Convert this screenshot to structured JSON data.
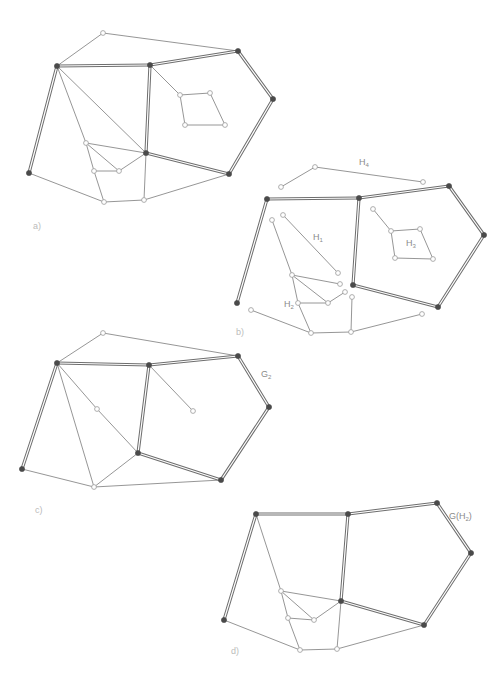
{
  "figure": {
    "panels": [
      {
        "id": "a",
        "label": "a)",
        "pos": [
          33,
          221
        ]
      },
      {
        "id": "b",
        "label": "b)",
        "pos": [
          236,
          327
        ]
      },
      {
        "id": "c",
        "label": "c)",
        "pos": [
          35,
          505
        ]
      },
      {
        "id": "d",
        "label": "d)",
        "pos": [
          231,
          646
        ]
      }
    ],
    "graph_labels": [
      {
        "id": "H4",
        "main": "H",
        "sub": "4",
        "pos": [
          359,
          157
        ]
      },
      {
        "id": "H1",
        "main": "H",
        "sub": "1",
        "pos": [
          313,
          232
        ]
      },
      {
        "id": "H3",
        "main": "H",
        "sub": "3",
        "pos": [
          406,
          238
        ]
      },
      {
        "id": "H2",
        "main": "H",
        "sub": "2",
        "pos": [
          284,
          299
        ]
      },
      {
        "id": "G2",
        "main": "G",
        "sub": "2",
        "pos": [
          261,
          369
        ]
      },
      {
        "id": "GH2",
        "main": "G(H",
        "sub": "2",
        "tail": ")",
        "pos": [
          449,
          511
        ]
      }
    ],
    "colors": {
      "edge": "#8a8a8a",
      "thick_edge": "#6e6e6e",
      "filled_node": "#4a4a4a",
      "hollow_node_stroke": "#9a9a9a"
    }
  },
  "graphs": {
    "a": {
      "nodes": {
        "t": [
          103,
          33,
          "h"
        ],
        "p1": [
          57,
          66,
          "f"
        ],
        "p2": [
          150,
          65,
          "f"
        ],
        "p3": [
          238,
          51,
          "f"
        ],
        "p4": [
          273,
          99,
          "f"
        ],
        "p5": [
          229,
          174,
          "f"
        ],
        "p6": [
          146,
          153,
          "f"
        ],
        "p7": [
          29,
          173,
          "f"
        ],
        "s1": [
          180,
          95,
          "h"
        ],
        "s2": [
          210,
          93,
          "h"
        ],
        "s3": [
          225,
          125,
          "h"
        ],
        "s4": [
          185,
          125,
          "h"
        ],
        "A": [
          86,
          143,
          "h"
        ],
        "B": [
          119,
          171,
          "h"
        ],
        "C": [
          94,
          171,
          "h"
        ],
        "D": [
          104,
          202,
          "h"
        ],
        "E": [
          144,
          200,
          "h"
        ]
      },
      "thick": [
        [
          "p1",
          "p2"
        ],
        [
          "p2",
          "p3"
        ],
        [
          "p3",
          "p4"
        ],
        [
          "p4",
          "p5"
        ],
        [
          "p5",
          "p6"
        ],
        [
          "p6",
          "p2"
        ],
        [
          "p1",
          "p7"
        ]
      ],
      "thin": [
        [
          "p1",
          "t"
        ],
        [
          "t",
          "p3"
        ],
        [
          "p1",
          "p6"
        ],
        [
          "p1",
          "A"
        ],
        [
          "A",
          "C"
        ],
        [
          "C",
          "D"
        ],
        [
          "A",
          "p6"
        ],
        [
          "A",
          "B"
        ],
        [
          "C",
          "B"
        ],
        [
          "B",
          "p6"
        ],
        [
          "p6",
          "E"
        ],
        [
          "p7",
          "D"
        ],
        [
          "D",
          "E"
        ],
        [
          "E",
          "p5"
        ],
        [
          "p2",
          "s1"
        ],
        [
          "s1",
          "s2"
        ],
        [
          "s2",
          "s3"
        ],
        [
          "s3",
          "s4"
        ],
        [
          "s4",
          "s1"
        ]
      ]
    },
    "b": {
      "nodes": {
        "h4a": [
          281,
          187,
          "h"
        ],
        "h4b": [
          315,
          167,
          "h"
        ],
        "h4c": [
          423,
          182,
          "h"
        ],
        "q1": [
          237,
          303,
          "f"
        ],
        "q2": [
          267,
          199,
          "f"
        ],
        "q3": [
          359,
          198,
          "f"
        ],
        "q4": [
          449,
          186,
          "f"
        ],
        "q5": [
          484,
          235,
          "f"
        ],
        "q6": [
          438,
          307,
          "f"
        ],
        "q7": [
          353,
          285,
          "f"
        ],
        "r0": [
          373,
          209,
          "h"
        ],
        "r1": [
          391,
          231,
          "h"
        ],
        "r2": [
          420,
          229,
          "h"
        ],
        "r3": [
          433,
          259,
          "h"
        ],
        "r4": [
          395,
          258,
          "h"
        ],
        "u1": [
          283,
          215,
          "h"
        ],
        "u2": [
          338,
          273,
          "h"
        ],
        "v1": [
          272,
          220,
          "h"
        ],
        "v2": [
          292,
          275,
          "h"
        ],
        "v3": [
          340,
          284,
          "h"
        ],
        "v4": [
          298,
          303,
          "h"
        ],
        "v5": [
          328,
          303,
          "h"
        ],
        "v6": [
          345,
          292,
          "h"
        ],
        "w1": [
          251,
          310,
          "h"
        ],
        "w2": [
          311,
          333,
          "h"
        ],
        "w3": [
          351,
          332,
          "h"
        ],
        "w4": [
          422,
          314,
          "h"
        ],
        "w5": [
          352,
          297,
          "h"
        ]
      },
      "thick": [
        [
          "q1",
          "q2"
        ],
        [
          "q2",
          "q3"
        ],
        [
          "q3",
          "q4"
        ],
        [
          "q4",
          "q5"
        ],
        [
          "q5",
          "q6"
        ],
        [
          "q6",
          "q7"
        ],
        [
          "q7",
          "q3"
        ]
      ],
      "thin": [
        [
          "h4a",
          "h4b"
        ],
        [
          "h4b",
          "h4c"
        ],
        [
          "r0",
          "r1"
        ],
        [
          "r1",
          "r2"
        ],
        [
          "r2",
          "r3"
        ],
        [
          "r3",
          "r4"
        ],
        [
          "r4",
          "r1"
        ],
        [
          "u1",
          "u2"
        ],
        [
          "v1",
          "v2"
        ],
        [
          "v2",
          "v3"
        ],
        [
          "v2",
          "v5"
        ],
        [
          "v2",
          "v4"
        ],
        [
          "v4",
          "v5"
        ],
        [
          "v5",
          "v6"
        ],
        [
          "v4",
          "w2"
        ],
        [
          "w1",
          "w2"
        ],
        [
          "w2",
          "w3"
        ],
        [
          "w3",
          "w4"
        ],
        [
          "w3",
          "w5"
        ]
      ]
    },
    "c": {
      "nodes": {
        "t": [
          103,
          333,
          "h"
        ],
        "p1": [
          57,
          363,
          "f"
        ],
        "p2": [
          149,
          365,
          "f"
        ],
        "p3": [
          238,
          356,
          "f"
        ],
        "p4": [
          269,
          407,
          "f"
        ],
        "p5": [
          221,
          480,
          "f"
        ],
        "p6": [
          138,
          453,
          "f"
        ],
        "p7": [
          22,
          469,
          "f"
        ],
        "m": [
          97,
          409,
          "h"
        ],
        "n": [
          193,
          411,
          "h"
        ],
        "b": [
          94,
          487,
          "h"
        ]
      },
      "thick": [
        [
          "p1",
          "p2"
        ],
        [
          "p2",
          "p3"
        ],
        [
          "p3",
          "p4"
        ],
        [
          "p4",
          "p5"
        ],
        [
          "p5",
          "p6"
        ],
        [
          "p6",
          "p2"
        ],
        [
          "p1",
          "p7"
        ]
      ],
      "thin": [
        [
          "p1",
          "t"
        ],
        [
          "t",
          "p3"
        ],
        [
          "p1",
          "m"
        ],
        [
          "m",
          "p6"
        ],
        [
          "p1",
          "b"
        ],
        [
          "p2",
          "n"
        ],
        [
          "p7",
          "b"
        ],
        [
          "b",
          "p6"
        ],
        [
          "b",
          "p5"
        ]
      ]
    },
    "d": {
      "nodes": {
        "p1": [
          256,
          514,
          "f"
        ],
        "p2": [
          348,
          514,
          "f"
        ],
        "p3": [
          437,
          503,
          "f"
        ],
        "p4": [
          471,
          553,
          "f"
        ],
        "p5": [
          424,
          625,
          "f"
        ],
        "p6": [
          341,
          601,
          "f"
        ],
        "p7": [
          224,
          620,
          "f"
        ],
        "A": [
          281,
          591,
          "h"
        ],
        "C": [
          288,
          618,
          "h"
        ],
        "B": [
          314,
          620,
          "h"
        ],
        "D": [
          300,
          650,
          "h"
        ],
        "E": [
          337,
          649,
          "h"
        ]
      },
      "thick": [
        [
          "p1",
          "p2"
        ],
        [
          "p2",
          "p3"
        ],
        [
          "p3",
          "p4"
        ],
        [
          "p4",
          "p5"
        ],
        [
          "p5",
          "p6"
        ],
        [
          "p6",
          "p2"
        ],
        [
          "p1",
          "p7"
        ]
      ],
      "thin": [
        [
          "p1",
          "A"
        ],
        [
          "A",
          "C"
        ],
        [
          "C",
          "D"
        ],
        [
          "A",
          "p6"
        ],
        [
          "A",
          "B"
        ],
        [
          "C",
          "B"
        ],
        [
          "B",
          "p6"
        ],
        [
          "p6",
          "E"
        ],
        [
          "p7",
          "D"
        ],
        [
          "D",
          "E"
        ],
        [
          "E",
          "p5"
        ]
      ]
    }
  }
}
